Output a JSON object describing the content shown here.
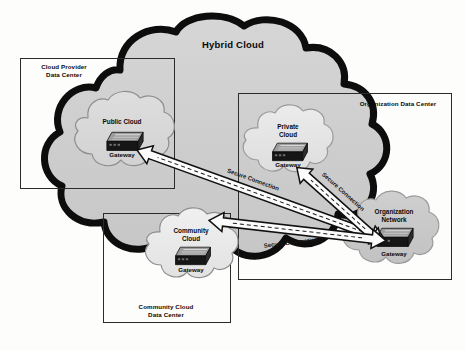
{
  "diagram": {
    "type": "hybrid-cloud-architecture",
    "title": "Hybrid Cloud",
    "background_color": "#fdfdfc",
    "outer_cloud": {
      "label": "Hybrid Cloud",
      "fill": "#cfcfcf",
      "stroke": "#111111"
    },
    "boxes": [
      {
        "id": "cloud-provider-data-center",
        "label_line1": "Cloud Provider",
        "label_line2": "Data Center",
        "stroke": "#2b2b2b"
      },
      {
        "id": "organization-data-center",
        "label_line1": "Organization Data Center",
        "label_line2": "",
        "stroke": "#2b2b2b"
      },
      {
        "id": "community-cloud-data-center",
        "label_line1": "Community Cloud",
        "label_line2": "Data Center",
        "stroke": "#2b2b2b"
      }
    ],
    "clouds": [
      {
        "id": "public-cloud",
        "label_line1": "Public Cloud",
        "label_line2": "",
        "gateway_label": "Gateway",
        "fill": "#d9d9d9",
        "stroke": "#8a8a8a"
      },
      {
        "id": "private-cloud",
        "label_line1": "Private",
        "label_line2": "Cloud",
        "gateway_label": "Gateway",
        "fill": "#e6e6e6",
        "stroke": "#9a9a9a"
      },
      {
        "id": "community-cloud",
        "label_line1": "Community",
        "label_line2": "Cloud",
        "gateway_label": "Gateway",
        "fill": "#ececec",
        "stroke": "#8a8a8a"
      },
      {
        "id": "organization-network",
        "label_line1": "Organization",
        "label_line2": "Network",
        "gateway_label": "Gateway",
        "fill": "#c9c9c9",
        "stroke": "#9a9a9a"
      }
    ],
    "connections": [
      {
        "id": "conn-public",
        "label": "Secure Connection",
        "from": "organization-network-gateway",
        "to": "public-cloud-gateway",
        "style": "double-headed-arrow-with-dashed-centerline"
      },
      {
        "id": "conn-private",
        "label": "Secure Connection",
        "from": "organization-network-gateway",
        "to": "private-cloud-gateway",
        "style": "double-headed-arrow-with-dashed-centerline"
      },
      {
        "id": "conn-community",
        "label": "Secure Connection",
        "from": "organization-network-gateway",
        "to": "community-cloud-gateway",
        "style": "double-headed-arrow-with-dashed-centerline"
      }
    ],
    "gateway_device": {
      "name": "gateway-device-icon",
      "description": "isometric router appliance",
      "body_color": "#1d1d1d",
      "top_color": "#9a9a9a"
    }
  }
}
